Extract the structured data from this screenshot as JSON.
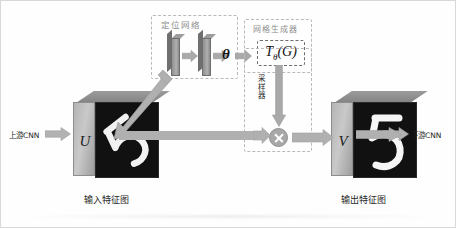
{
  "figure": {
    "background_color": "#fefefe",
    "border_color": "#d8d8d8"
  },
  "modules": {
    "localisation_network": {
      "label": "定位网络",
      "label_color": "#8d8d8d",
      "layers": [
        "conv-slab-1",
        "conv-slab-2"
      ]
    },
    "grid_generator": {
      "label": "网格生成器",
      "label_color": "#8d8d8d",
      "transform_box": {
        "symbol": "T",
        "subscript": "θ",
        "argument": "(G)",
        "full": "Tθ(G)"
      }
    },
    "sampler": {
      "label_chars": [
        "采",
        "样",
        "器"
      ],
      "label": "采样器"
    }
  },
  "parameters": {
    "theta_symbol": "θ"
  },
  "feature_maps": {
    "input": {
      "letter": "U",
      "caption": "输入特征图",
      "digit": "5",
      "digit_state": "distorted"
    },
    "output": {
      "letter": "V",
      "caption": "输出特征图",
      "digit": "5",
      "digit_state": "upright"
    }
  },
  "io": {
    "upstream": {
      "label": "上游CNN",
      "icon": "right-arrow-icon"
    },
    "downstream": {
      "label": "下游CNN",
      "icon": "right-arrow-icon"
    }
  },
  "operators": {
    "multiply": {
      "symbol": "×",
      "name": "sampling-multiply-node"
    }
  },
  "colors": {
    "arrow_fill": "#a9a9a9",
    "arrow_stroke": "#9a9a9a",
    "dash_border": "#b9b9b9",
    "slab_fill": "#a0a0a0",
    "cube_face": "#111111",
    "cube_side": "#bdbdbd",
    "text": "#1f1f1f"
  }
}
